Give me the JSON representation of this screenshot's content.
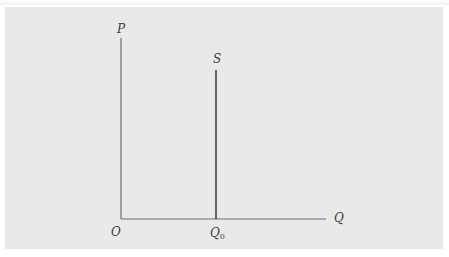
{
  "diagram": {
    "type": "supply-curve",
    "axes": {
      "y_label": "P",
      "x_label": "Q",
      "origin_label": "O"
    },
    "curves": [
      {
        "name": "S",
        "label": "S",
        "kind": "vertical-line",
        "at_x_label": "Q0"
      }
    ],
    "x_ticks": [
      {
        "label_main": "Q",
        "label_sub": "0"
      }
    ]
  },
  "colors": {
    "panel_background": "#e9e9e9",
    "page_background": "#ffffff",
    "axis_line": "#6e6e6e",
    "supply_line": "#2e2e2e",
    "label_text": "#3a3a3a"
  }
}
